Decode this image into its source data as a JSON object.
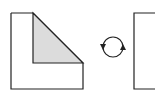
{
  "diagram": {
    "colors": {
      "stroke": "#222222",
      "fill_shaded": "#dcdcdc",
      "fill_background": "#ffffff"
    },
    "left_shape": {
      "outer": {
        "x": 11,
        "y": 13,
        "w": 72,
        "h": 76
      },
      "shaded_triangle": [
        [
          33,
          13
        ],
        [
          83,
          63
        ],
        [
          33,
          63
        ]
      ]
    },
    "rotate_icon": {
      "cx": 113,
      "cy": 47,
      "r": 10,
      "direction": "clockwise"
    },
    "right_shape": {
      "x": 134,
      "y": 13,
      "w": 30,
      "h": 76
    }
  }
}
